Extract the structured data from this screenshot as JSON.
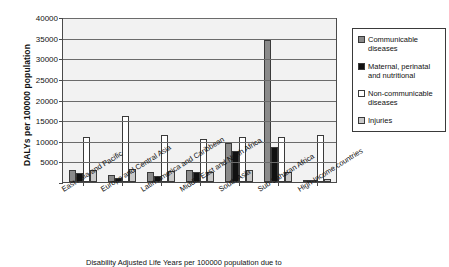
{
  "chart_data": {
    "type": "bar",
    "title": "",
    "xlabel": "",
    "ylabel": "DALYs per 100000 population",
    "ylim": [
      0,
      40000
    ],
    "ytick_labels": [
      "40000",
      "35000",
      "30000",
      "25000",
      "20000",
      "15000",
      "10000",
      "5000",
      "0"
    ],
    "ytick_values": [
      40000,
      35000,
      30000,
      25000,
      20000,
      15000,
      10000,
      5000,
      0
    ],
    "grid": true,
    "legend_position": "right",
    "categories": [
      "East Asia and Pacific",
      "Europe and Central Asia",
      "Latin America and Caribbean",
      "Middle East and North Africa",
      "South Asia",
      "Sub-Saharan Africa",
      "High-Income countries"
    ],
    "series": [
      {
        "name": "Communicable diseases",
        "color": "#8a8a8a",
        "values": [
          3000,
          1700,
          2400,
          2800,
          9500,
          34500,
          600
        ]
      },
      {
        "name": "Maternal, perinatal and nutritional",
        "color": "#111111",
        "values": [
          2200,
          900,
          1400,
          2400,
          7500,
          8500,
          250
        ]
      },
      {
        "name": "Non-communicable diseases",
        "color": "#ffffff",
        "values": [
          11000,
          16000,
          11500,
          10500,
          11000,
          11000,
          11500
        ]
      },
      {
        "name": "Injuries",
        "color": "#c9c9c9",
        "values": [
          2800,
          3100,
          2700,
          2400,
          2800,
          2500,
          800
        ]
      }
    ]
  },
  "legend": {
    "entries": [
      "Communicable diseases",
      "Maternal, perinatal and nutritional",
      "Non-communicable diseases",
      "Injuries"
    ]
  },
  "caption": "Disability Adjusted Life Years per 100000 population due to"
}
